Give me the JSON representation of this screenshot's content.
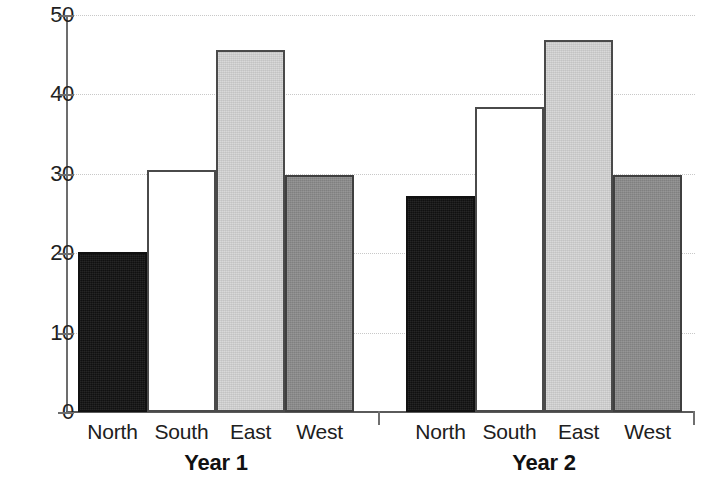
{
  "chart_data": {
    "type": "bar",
    "title": "",
    "subtitle": "",
    "xlabel": "",
    "ylabel": "",
    "ylim": [
      0,
      50
    ],
    "yticks": [
      0,
      10,
      20,
      30,
      40,
      50
    ],
    "ytick_labels": [
      "0",
      "10",
      "20",
      "30",
      "40",
      "50"
    ],
    "grid": true,
    "grid_style": "dotted horizontal",
    "legend": "none",
    "categories": [
      "North",
      "South",
      "East",
      "West"
    ],
    "groups": [
      "Year 1",
      "Year 2"
    ],
    "series": [
      {
        "name": "Year 1",
        "values": [
          20.2,
          30.5,
          45.6,
          29.8
        ]
      },
      {
        "name": "Year 2",
        "values": [
          27.2,
          38.4,
          46.8,
          29.8
        ]
      }
    ],
    "bar_colors": {
      "North": "#111111",
      "South": "#ffffff",
      "East": "#d5d5d5",
      "West": "#8c8c8c"
    },
    "bar_edge_color": "#3f3f3f",
    "axis_color": "#6d6d6d",
    "gridline_color": "#c8c8c8",
    "background": "#ffffff"
  },
  "axis": {
    "y_tick_labels": [
      "50",
      "40",
      "30",
      "20",
      "10",
      "0"
    ]
  },
  "groups": [
    {
      "label": "Year 1",
      "bars": [
        {
          "category": "North",
          "value": 20.2,
          "style": "north"
        },
        {
          "category": "South",
          "value": 30.5,
          "style": "south"
        },
        {
          "category": "East",
          "value": 45.6,
          "style": "east"
        },
        {
          "category": "West",
          "value": 29.8,
          "style": "west"
        }
      ]
    },
    {
      "label": "Year 2",
      "bars": [
        {
          "category": "North",
          "value": 27.2,
          "style": "north"
        },
        {
          "category": "South",
          "value": 38.4,
          "style": "south"
        },
        {
          "category": "East",
          "value": 46.8,
          "style": "east"
        },
        {
          "category": "West",
          "value": 29.8,
          "style": "west"
        }
      ]
    }
  ]
}
